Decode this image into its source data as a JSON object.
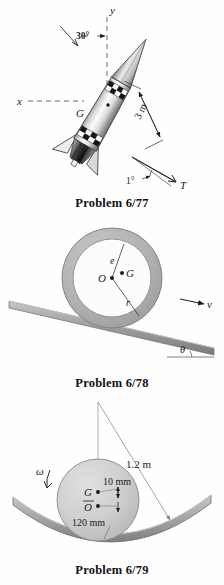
{
  "page": {
    "type": "textbook-problem-figures",
    "background_color": "#ffffff",
    "ink_color": "#1b1b1b",
    "figure_count": 3
  },
  "figures": [
    {
      "id": "problem-6-77",
      "caption": "Problem 6/77",
      "subject": "rocket in flight with thrust vector",
      "labels": {
        "axis_y": "y",
        "axis_x": "x",
        "angle_attitude": "30°",
        "center_of_mass": "G",
        "dimension_length": "3 m",
        "angle_thrust": "1°",
        "thrust_force": "T"
      },
      "colors": {
        "body_light": "#f2f2f2",
        "body_mid": "#b9b9b9",
        "body_dark": "#4a4a4a",
        "outline": "#2a2a2a"
      }
    },
    {
      "id": "problem-6-78",
      "caption": "Problem 6/78",
      "subject": "eccentric ring rolling on an inclined surface",
      "labels": {
        "center": "O",
        "mass_center": "G",
        "eccentricity": "e",
        "radius": "r",
        "velocity": "v",
        "incline_angle": "θ"
      },
      "colors": {
        "ring_fill": "#b4b4b4",
        "ring_inner": "#fcfcfc",
        "ring_edge": "#7d7d7d",
        "incline_fill": "#9b9b9b",
        "incline_edge": "#6e6e6e"
      }
    },
    {
      "id": "problem-6-79",
      "caption": "Problem 6/79",
      "subject": "eccentric cylinder rolling inside a circular trough",
      "labels": {
        "mass_center": "G",
        "geometric_center": "O",
        "offset": "10 mm",
        "diameter": "120 mm",
        "trough_radius": "1.2 m",
        "angular_velocity": "ω"
      },
      "colors": {
        "cylinder_fill": "#cfcfcf",
        "cylinder_edge": "#8a8a8a",
        "trough_fill": "#a5a5a5",
        "trough_edge": "#707070",
        "leader_line": "#8e8e8e"
      }
    }
  ]
}
